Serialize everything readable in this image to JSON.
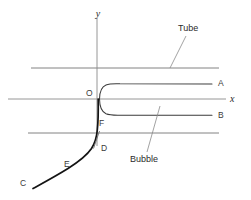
{
  "figure": {
    "title_visible": false,
    "background_color": "#ffffff",
    "line_color": "#6f6f6f",
    "curve_color": "#1f1f1f",
    "axis_color": "#7a7a7a",
    "text_color": "#2b2b2b"
  },
  "axes": {
    "y_label": "y",
    "x_label": "x",
    "origin_label": "O"
  },
  "annotations": {
    "tube_label": "Tube",
    "bubble_label": "Bubble"
  },
  "curve_points": {
    "a_label": "A",
    "b_label": "B",
    "c_label": "C",
    "d_label": "D",
    "e_label": "E",
    "f_label": "F"
  },
  "geometry": {
    "origin_x": 97,
    "origin_y": 99,
    "tube_top_y": 68,
    "tube_bottom_y": 133,
    "tube_left_x": 31,
    "tube_right_x": 219,
    "a_line_y": 84,
    "b_line_y": 115,
    "branch_right_x": 212,
    "x_axis_left_x": 8,
    "x_axis_right_x": 226,
    "y_axis_top_y": 18,
    "y_axis_bottom_y": 146
  }
}
